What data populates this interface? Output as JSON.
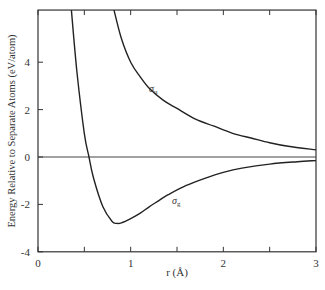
{
  "chart_data": {
    "type": "line",
    "title": "",
    "xlabel": "r (Å)",
    "ylabel": "Energy Relative to Separate Atoms (eV/atom)",
    "xlim": [
      0,
      3
    ],
    "ylim": [
      -4,
      6.2
    ],
    "xticks": [
      0,
      1,
      2,
      3
    ],
    "xminor_ticks": [
      0.5,
      1.5,
      2.5
    ],
    "yticks": [
      -4,
      -2,
      0,
      2,
      4
    ],
    "grid": false,
    "reference_line": {
      "y": 0
    },
    "series": [
      {
        "name": "σg",
        "label": "σ",
        "label_sub": "g",
        "x": [
          0.36,
          0.42,
          0.5,
          0.55,
          0.6,
          0.7,
          0.8,
          0.85,
          0.9,
          1.0,
          1.1,
          1.2,
          1.3,
          1.4,
          1.6,
          1.8,
          2.0,
          2.2,
          2.5,
          2.8,
          3.0
        ],
        "values": [
          6.2,
          3.6,
          1.0,
          0.0,
          -0.9,
          -2.1,
          -2.72,
          -2.8,
          -2.78,
          -2.6,
          -2.38,
          -2.1,
          -1.85,
          -1.6,
          -1.2,
          -0.9,
          -0.65,
          -0.47,
          -0.3,
          -0.2,
          -0.15
        ]
      },
      {
        "name": "σu",
        "label": "σ",
        "label_sub": "u",
        "x": [
          0.82,
          0.9,
          1.0,
          1.1,
          1.2,
          1.35,
          1.5,
          1.7,
          1.9,
          2.1,
          2.3,
          2.5,
          2.7,
          3.0
        ],
        "values": [
          6.2,
          5.0,
          4.0,
          3.4,
          2.9,
          2.4,
          2.05,
          1.6,
          1.3,
          1.0,
          0.8,
          0.6,
          0.45,
          0.3
        ]
      }
    ],
    "annotations": [
      {
        "text": "σu",
        "x": 1.18,
        "y": 3.5
      },
      {
        "text": "σg",
        "x": 1.45,
        "y": -2.2
      }
    ]
  },
  "labels": {
    "xlabel": "r (Å)",
    "ylabel": "Energy Relative to Separate Atoms (eV/atom)",
    "sigma": "σ",
    "sub_u": "u",
    "sub_g": "g"
  }
}
